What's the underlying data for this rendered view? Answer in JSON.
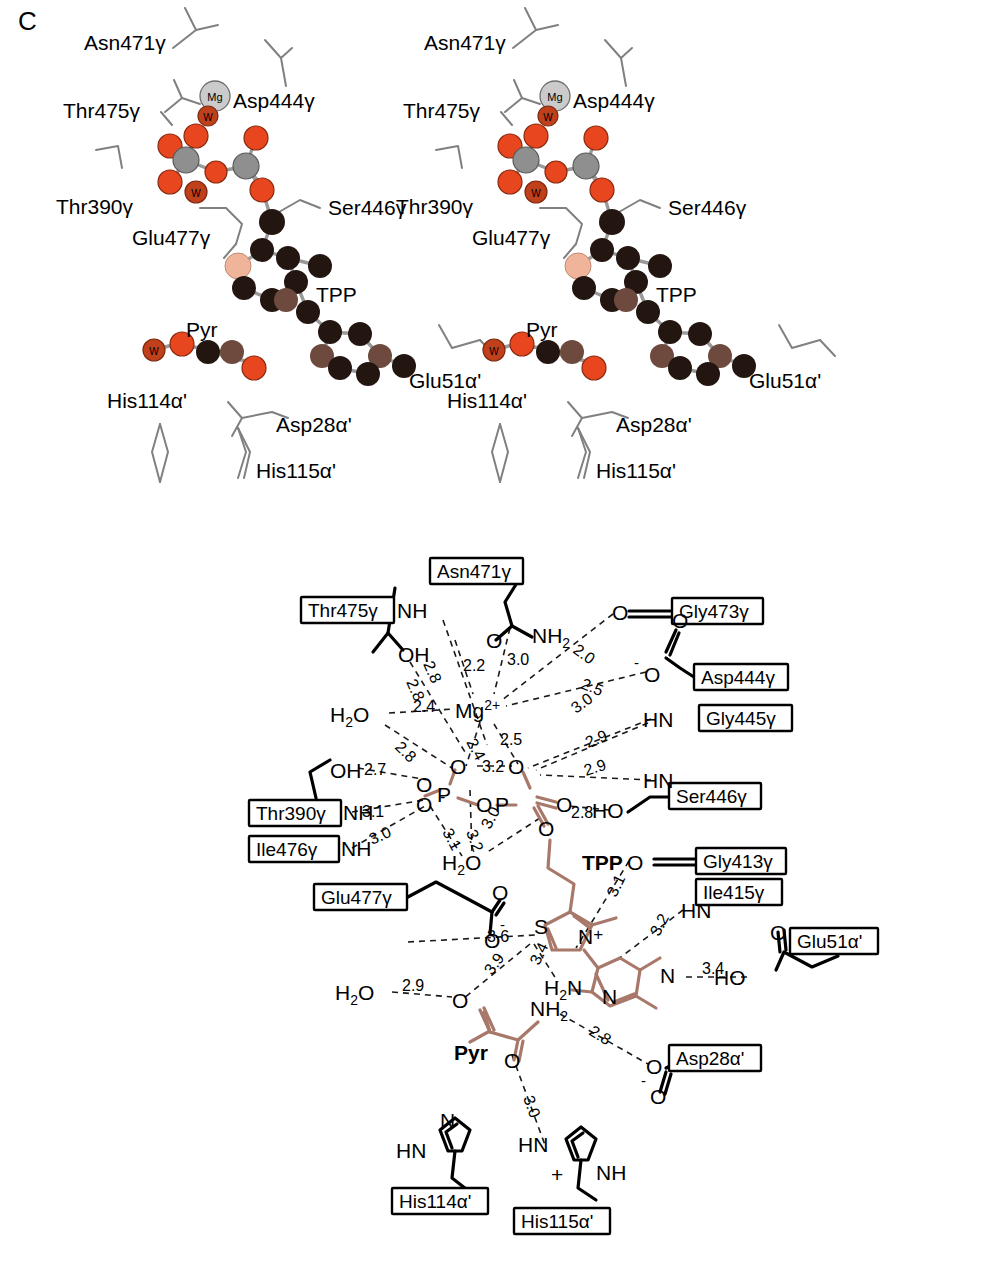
{
  "figure": {
    "panel_letter": "C",
    "type": "stereo-pair structure + schematic interaction diagram",
    "caption_absent": true
  },
  "stereo": {
    "count": 2,
    "labels": [
      "Asn471γ",
      "Asp444γ",
      "Thr475γ",
      "Thr390γ",
      "Ser446γ",
      "Glu477γ",
      "TPP",
      "Pyr",
      "His114α'",
      "Asp28α'",
      "His115α'",
      "Glu51α'"
    ],
    "atom_badges": [
      "Mg",
      "W"
    ],
    "colors": {
      "oxygen": "#e8461e",
      "phosphorus": "#8f8f8f",
      "carbon": "#241712",
      "carbon_light": "#6d4a3d",
      "sulfur": "#f0b49a",
      "magnesium": "#c9c9c9",
      "water": "#c1401c",
      "sticks": "#808080"
    }
  },
  "schematic": {
    "accent_color": "#a8796b",
    "ligand_labels": [
      "TPP",
      "Pyr"
    ],
    "residue_boxes": [
      "Asn471γ",
      "Thr475γ",
      "Gly473γ",
      "Asp444γ",
      "Gly445γ",
      "Ser446γ",
      "Thr390γ",
      "Ile476γ",
      "Glu477γ",
      "Gly413γ",
      "Ile415γ",
      "Glu51α'",
      "Asp28α'",
      "His114α'",
      "His115α'"
    ],
    "atom_labels": [
      "NH",
      "OH",
      "NH2",
      "O",
      "Mg2+",
      "H2O",
      "HN",
      "HO",
      "P",
      "S",
      "N+",
      "H2N",
      "N",
      "+NH"
    ],
    "water_label": "H₂O",
    "metal_label": "Mg",
    "metal_charge": "2+",
    "distances": [
      {
        "value": "2.8",
        "between": "Thr475γ NH ↔ diphosphate O"
      },
      {
        "value": "2.8",
        "between": "Thr475γ OH ↔ diphosphate O"
      },
      {
        "value": "2.2",
        "between": "Asn471γ O ↔ Mg2+"
      },
      {
        "value": "3.0",
        "between": "Asn471γ NH2 ↔ Mg2+"
      },
      {
        "value": "2.0",
        "between": "Gly473γ O ↔ Mg2+"
      },
      {
        "value": "2.5",
        "between": "Asp444γ O- ↔ Mg2+"
      },
      {
        "value": "2.4",
        "between": "H2O ↔ Mg2+"
      },
      {
        "value": "2.4",
        "between": "Mg2+ ↔ diphosphate O"
      },
      {
        "value": "2.5",
        "between": "Mg2+ ↔ diphosphate O"
      },
      {
        "value": "2.8",
        "between": "H2O ↔ diphosphate O"
      },
      {
        "value": "2.7",
        "between": "Thr390γ OH ↔ diphosphate O"
      },
      {
        "value": "3.1",
        "between": "Thr390γ NH ↔ diphosphate O"
      },
      {
        "value": "3.0",
        "between": "Ile476γ NH ↔ diphosphate O"
      },
      {
        "value": "3.2",
        "between": "bridging diphosphate O↔O"
      },
      {
        "value": "3.1",
        "between": "diphosphate O ↔ H2O"
      },
      {
        "value": "3.2",
        "between": "diphosphate O ↔ H2O"
      },
      {
        "value": "3.0",
        "between": "diphosphate O ↔ H2O"
      },
      {
        "value": "3.0",
        "between": "Gly445γ HN ↔ diphosphate O"
      },
      {
        "value": "2.9",
        "between": "Gly445γ HN ↔ diphosphate O"
      },
      {
        "value": "2.9",
        "between": "Ser446γ HN ↔ diphosphate O"
      },
      {
        "value": "2.8",
        "between": "Ser446γ HO ↔ diphosphate O"
      },
      {
        "value": "3.1",
        "between": "Gly413γ O ↔ TPP C2α"
      },
      {
        "value": "3.2",
        "between": "Ile415γ HN ↔ pyrimidine"
      },
      {
        "value": "3.4",
        "between": "Glu51α' HO ↔ pyrimidine N1'"
      },
      {
        "value": "3.6",
        "between": "Glu477γ O- ↔ thiazolium C2"
      },
      {
        "value": "3.9",
        "between": "thiazolium C2 ↔ Pyr O"
      },
      {
        "value": "3.4",
        "between": "thiazolium C2 ↔ H2N"
      },
      {
        "value": "2.9",
        "between": "H2O ↔ Pyr O"
      },
      {
        "value": "2.8",
        "between": "Pyr NH2 ↔ Asp28α' O-"
      },
      {
        "value": "3.0",
        "between": "Pyr O ↔ His115α' HN"
      }
    ]
  }
}
